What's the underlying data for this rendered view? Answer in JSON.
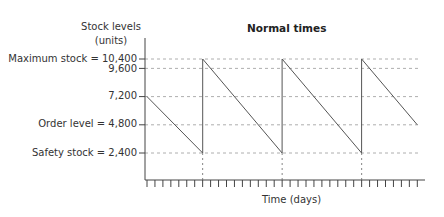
{
  "chart_data": {
    "type": "line",
    "title": "Normal times",
    "xlabel": "Time (days)",
    "ylabel": "Stock levels (units)",
    "ylabel_lines": [
      "Stock levels",
      "(units)"
    ],
    "y_ticks": [
      {
        "value": 10400,
        "label": "Maximum stock = 10,400"
      },
      {
        "value": 9600,
        "label": "9,600"
      },
      {
        "value": 7200,
        "label": "7,200"
      },
      {
        "value": 4800,
        "label": "Order level = 4,800"
      },
      {
        "value": 2400,
        "label": "Safety stock = 2,400"
      }
    ],
    "x_tick_count": 35,
    "x_unit": "days",
    "grid": "dashed horizontal at each labelled level; dashed vertical at each reorder point",
    "series": [
      {
        "name": "Stock level",
        "x": [
          0,
          7,
          7,
          17,
          17,
          27,
          27,
          34
        ],
        "values": [
          7200,
          2400,
          10400,
          2400,
          10400,
          2400,
          10400,
          4800
        ]
      }
    ],
    "ylim": [
      0,
      12000
    ]
  }
}
